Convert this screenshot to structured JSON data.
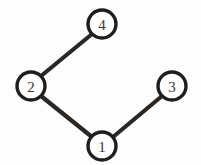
{
  "figure": {
    "background_color": "#fdfdfd",
    "edge_color": "#2a2725",
    "node_fill_color": "#ffffff",
    "node_stroke_color": "#201d1c",
    "node_label_color": "#3a3634",
    "width": 201,
    "height": 165
  },
  "chart_data": {
    "type": "diagram",
    "subtype": "node-link-graph",
    "directed": false,
    "title": "",
    "nodes": [
      {
        "id": "1",
        "label": "1",
        "x": 102,
        "y": 146,
        "r": 14
      },
      {
        "id": "2",
        "label": "2",
        "x": 31,
        "y": 86,
        "r": 14
      },
      {
        "id": "3",
        "label": "3",
        "x": 172,
        "y": 86,
        "r": 14
      },
      {
        "id": "4",
        "label": "4",
        "x": 102,
        "y": 24,
        "r": 14
      }
    ],
    "edges": [
      {
        "id": "edge-2-4",
        "source": "2",
        "target": "4",
        "x1": 41,
        "y1": 76,
        "x2": 92,
        "y2": 34
      },
      {
        "id": "edge-2-1",
        "source": "2",
        "target": "1",
        "x1": 41,
        "y1": 96,
        "x2": 92,
        "y2": 137
      },
      {
        "id": "edge-1-3",
        "source": "1",
        "target": "3",
        "x1": 113,
        "y1": 137,
        "x2": 162,
        "y2": 96
      }
    ],
    "node_count": 4,
    "edge_count": 3
  }
}
